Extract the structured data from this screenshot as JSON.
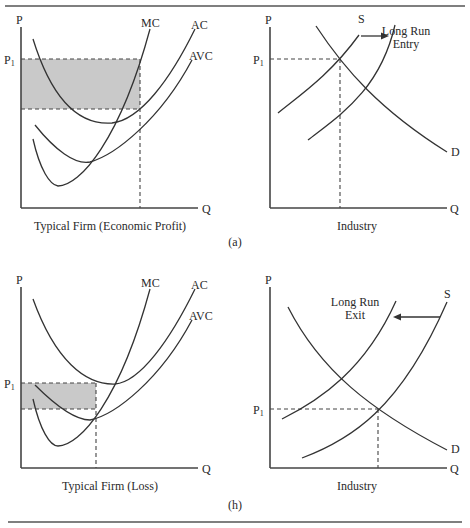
{
  "figure": {
    "top_rule": true,
    "bottom_rule": true
  },
  "panel_a": {
    "label": "(a)",
    "firm": {
      "y_axis_label": "P",
      "x_axis_label": "Q",
      "price_label": "P",
      "price_sub": "1",
      "curves": {
        "mc": "MC",
        "ac": "AC",
        "avc": "AVC"
      },
      "caption": "Typical Firm (Economic Profit)",
      "shaded_region": "economic profit"
    },
    "industry": {
      "y_axis_label": "P",
      "x_axis_label": "Q",
      "price_label": "P",
      "price_sub": "1",
      "supply_label": "S",
      "demand_label": "D",
      "shift_label_line1": "Long Run",
      "shift_label_line2": "Entry",
      "shift_direction": "right",
      "caption": "Industry"
    }
  },
  "panel_b": {
    "label": "(h)",
    "firm": {
      "y_axis_label": "P",
      "x_axis_label": "Q",
      "price_label": "P",
      "price_sub": "1",
      "curves": {
        "mc": "MC",
        "ac": "AC",
        "avc": "AVC"
      },
      "caption": "Typical Firm (Loss)",
      "shaded_region": "loss"
    },
    "industry": {
      "y_axis_label": "P",
      "x_axis_label": "Q",
      "price_label": "P",
      "price_sub": "1",
      "supply_label": "S",
      "demand_label": "D",
      "shift_label_line1": "Long Run",
      "shift_label_line2": "Exit",
      "shift_direction": "left",
      "caption": "Industry"
    }
  },
  "colors": {
    "line": "#333333",
    "shade": "#c9c9c9",
    "background": "#ffffff"
  }
}
